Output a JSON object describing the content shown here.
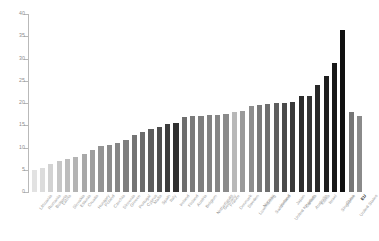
{
  "chart_data": {
    "type": "bar",
    "title": "",
    "subtitle": "",
    "xlabel": "",
    "ylabel": "",
    "ylim": [
      0,
      40
    ],
    "yticks": [
      0,
      5,
      10,
      15,
      20,
      25,
      30,
      35,
      40
    ],
    "ytick_labels": [
      "0",
      "5",
      "10",
      "15",
      "20",
      "25",
      "30",
      "35",
      "40"
    ],
    "grid": false,
    "legend": "none",
    "orientation": "vertical",
    "sorted": "ascending",
    "categories": [
      "Lithuania",
      "Romania",
      "Bulgaria",
      "Latvia",
      "Slovakia",
      "Estonia",
      "Croatia",
      "Hungary",
      "Poland",
      "Czechia",
      "Slovenia",
      "Greece",
      "Portugal",
      "Cyprus",
      "Malta",
      "Spain",
      "Italy",
      "Ireland",
      "Finland",
      "Austria",
      "Belgium",
      "Netherlands",
      "Germany",
      "France",
      "Denmark",
      "Sweden",
      "Luxembourg",
      "Norway",
      "Switzerland",
      "Iceland",
      "United Kingdom",
      "Japan",
      "Canada",
      "Australia",
      "Korea",
      "Israel",
      "Singapore",
      "China",
      "United States",
      "EU"
    ],
    "values": [
      5.0,
      5.4,
      6.2,
      7.0,
      7.5,
      7.9,
      8.6,
      9.5,
      10.4,
      10.6,
      11.0,
      11.8,
      12.8,
      13.5,
      14.2,
      14.6,
      15.2,
      15.4,
      16.8,
      17.0,
      17.1,
      17.3,
      17.4,
      17.6,
      17.9,
      18.2,
      19.4,
      19.6,
      19.8,
      19.9,
      20.0,
      20.2,
      21.5,
      21.5,
      24.0,
      26.0,
      29.0,
      36.3,
      18.0,
      17.0
    ],
    "bar_shades": [
      "#e2e2e2",
      "#dcdcdc",
      "#d2d2d2",
      "#c6c6c6",
      "#bcbcbc",
      "#b4b4b4",
      "#a8a8a8",
      "#9e9e9e",
      "#949494",
      "#8c8c8c",
      "#868686",
      "#7e7e7e",
      "#747474",
      "#6c6c6c",
      "#5e5e5e",
      "#4e4e4e",
      "#3c3c3c",
      "#303030",
      "#6e6e6e",
      "#7a7a7a",
      "#7e7e7e",
      "#828282",
      "#868686",
      "#8a8a8a",
      "#b8b8b8",
      "#9a9a9a",
      "#8e8e8e",
      "#7a7a7a",
      "#6e6e6e",
      "#5e5e5e",
      "#4a4a4a",
      "#3a3a3a",
      "#2c2c2c",
      "#343434",
      "#282828",
      "#1e1e1e",
      "#181818",
      "#101010",
      "#767676",
      "#8a8a8a"
    ],
    "emphasized_category": "EU",
    "axis_color": "#b9b9b9",
    "tick_label_color": "#8d8d8d",
    "category_label_color": "#9a9a9a",
    "background_color": "#ffffff"
  }
}
